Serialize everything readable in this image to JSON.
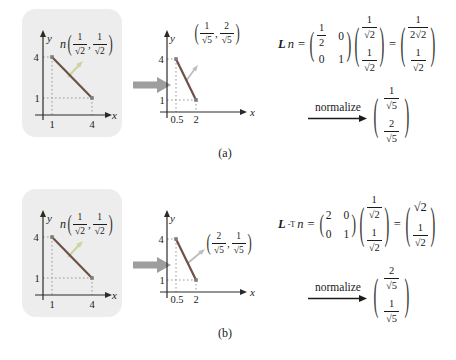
{
  "colors": {
    "panel_bg": "#ededed",
    "axis": "#2a2a2a",
    "text": "#1b1b1b",
    "segment": "#705048",
    "normal_green": "#c9d59b",
    "normal_gray": "#bdbdbd",
    "big_arrow": "#9e9e9e",
    "dotted": "#9a9a9a",
    "point": "#7d7d7d"
  },
  "syms": {
    "lparen": "(",
    "rparen": ")",
    "comma": ","
  },
  "panel_a": {
    "caption": "(a)",
    "left_plot": {
      "y_axis": "y",
      "x_axis": "x",
      "ytick_4": "4",
      "ytick_1": "1",
      "xtick_1": "1",
      "xtick_4": "4",
      "points": [
        [
          1,
          4
        ],
        [
          4,
          1
        ]
      ],
      "normal_name": "n",
      "nx_num": "1",
      "nx_den": "√2",
      "ny_num": "1",
      "ny_den": "√2"
    },
    "mid_plot": {
      "y_axis": "y",
      "x_axis": "x",
      "ytick_4": "4",
      "ytick_1": "1",
      "xtick_a": "0.5",
      "xtick_b": "2",
      "points": [
        [
          0.5,
          4
        ],
        [
          2,
          1
        ]
      ],
      "nx_num": "1",
      "nx_den": "√5",
      "ny_num": "2",
      "ny_den": "√5"
    },
    "equation": {
      "L": "L",
      "n": "n",
      "eq": "=",
      "m00_num": "1",
      "m00_den": "2",
      "m01": "0",
      "m10": "0",
      "m11": "1",
      "vx_num": "1",
      "vx_den": "√2",
      "vy_num": "1",
      "vy_den": "√2",
      "eq2": "=",
      "rx_num": "1",
      "rx_den": "2√2",
      "ry_num": "1",
      "ry_den": "√2"
    },
    "normalize": {
      "label": "normalize",
      "vx_num": "1",
      "vx_den": "√5",
      "vy_num": "2",
      "vy_den": "√5"
    }
  },
  "panel_b": {
    "caption": "(b)",
    "left_plot": {
      "y_axis": "y",
      "x_axis": "x",
      "ytick_4": "4",
      "ytick_1": "1",
      "xtick_1": "1",
      "xtick_4": "4",
      "points": [
        [
          1,
          4
        ],
        [
          4,
          1
        ]
      ],
      "normal_name": "n",
      "nx_num": "1",
      "nx_den": "√2",
      "ny_num": "1",
      "ny_den": "√2"
    },
    "mid_plot": {
      "y_axis": "y",
      "x_axis": "x",
      "ytick_4": "4",
      "ytick_1": "1",
      "xtick_a": "0.5",
      "xtick_b": "2",
      "points": [
        [
          0.5,
          4
        ],
        [
          2,
          1
        ]
      ],
      "nx_num": "2",
      "nx_den": "√5",
      "ny_num": "1",
      "ny_den": "√5"
    },
    "equation": {
      "L": "L",
      "sup": "-T",
      "n": "n",
      "eq": "=",
      "m00": "2",
      "m01": "0",
      "m10": "0",
      "m11": "1",
      "vx_num": "1",
      "vx_den": "√2",
      "vy_num": "1",
      "vy_den": "√2",
      "eq2": "=",
      "rx": "√2",
      "ry_num": "1",
      "ry_den": "√2"
    },
    "normalize": {
      "label": "normalize",
      "vx_num": "2",
      "vx_den": "√5",
      "vy_num": "1",
      "vy_den": "√5"
    }
  }
}
